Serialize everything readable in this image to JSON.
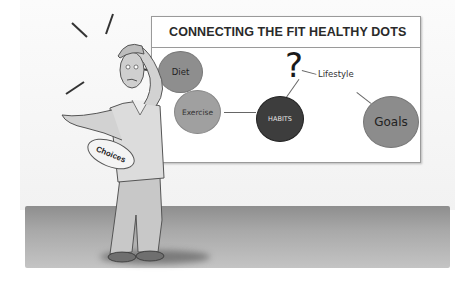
{
  "board": {
    "title": "CONNECTING THE FIT  HEALTHY DOTS",
    "nodes": {
      "diet": "Diet",
      "exercise": "Exercise",
      "habits": "HABITS",
      "goals": "Goals"
    },
    "question_mark": "?",
    "lifestyle_label": "Lifestyle"
  },
  "figure": {
    "badge_text": "Choices"
  },
  "colors": {
    "node_gray": "#8c8c8c",
    "habits_dark": "#3a3a3a",
    "floor": "#a0a0a0"
  }
}
